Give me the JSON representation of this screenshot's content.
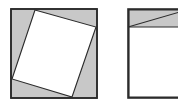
{
  "figure": {
    "canvas": {
      "width": 178,
      "height": 104,
      "background": "#ffffff"
    },
    "colors": {
      "shaded_fill": "#c8c8c8",
      "inner_fill": "#ffffff",
      "stroke": "#2b2b2b",
      "stroke_light": "#3a3a3a",
      "background": "#ffffff"
    },
    "stroke_widths": {
      "outer": 1.6,
      "inner": 1.1,
      "diagonal": 1.1
    },
    "panels": [
      {
        "id": "left-panel",
        "name": "tilted-inscribed-square",
        "description": "Outer square filled light gray with a tilted white square inscribed, touching each side, leaving four gray corner triangles",
        "outer_square": {
          "x": 11,
          "y": 9,
          "width": 86,
          "height": 89,
          "fill": "#c8c8c8",
          "stroke": "#2b2b2b"
        },
        "inner_square": {
          "fill": "#ffffff",
          "stroke": "#2b2b2b",
          "tilt_degrees": 16,
          "points": "35,10 96,27 72,97 12,79",
          "vertices": [
            {
              "label": "top",
              "x": 35,
              "y": 10
            },
            {
              "label": "right",
              "x": 96,
              "y": 27
            },
            {
              "label": "bottom",
              "x": 72,
              "y": 97
            },
            {
              "label": "left",
              "x": 12,
              "y": 79
            }
          ]
        }
      },
      {
        "id": "right-panel",
        "name": "square-with-top-band",
        "description": "Square clipped by the right image edge, with a shaded horizontal band across the top crossed by a diagonal line from the band's lower-left corner to its upper-right corner",
        "outer_square": {
          "x": 128,
          "y": 9,
          "width": 62,
          "height": 89,
          "fill": "#ffffff",
          "stroke": "#2b2b2b",
          "clipped_right": true
        },
        "band": {
          "x": 128,
          "y": 9,
          "width": 62,
          "height": 18,
          "fill": "#c8c8c8",
          "stroke": "#2b2b2b"
        },
        "diagonal": {
          "x1": 128,
          "y1": 27,
          "x2": 190,
          "y2": 9,
          "stroke": "#2b2b2b"
        }
      }
    ]
  }
}
